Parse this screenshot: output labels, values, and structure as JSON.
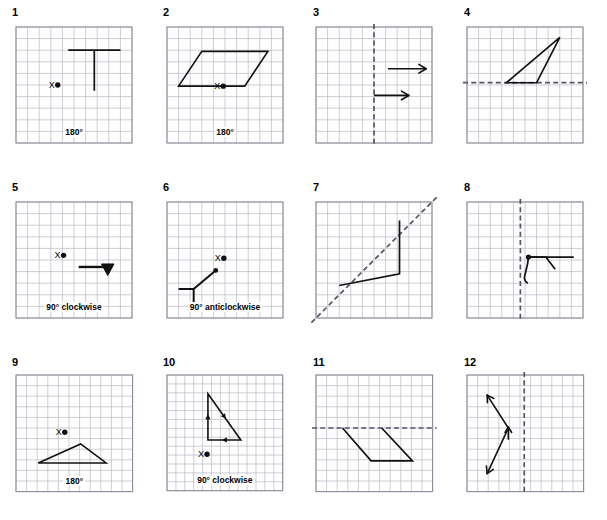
{
  "worksheet": {
    "title": "Transformations worksheet",
    "grid_color": "#b9b9c4",
    "grid_border_color": "#8e8e9c",
    "shape_color": "#111111",
    "mirror_color": "#555566",
    "background": "#ffffff",
    "rows": 3,
    "columns": 4
  },
  "panels": [
    {
      "number": "1",
      "type": "rotation",
      "caption": "180°",
      "center_label": "X",
      "grid": {
        "cols": 10,
        "rows": 10,
        "cell": 11.6
      },
      "shape": {
        "kind": "polyline",
        "points": "4.5,2 9,2 6.75,2 6.75,5.5"
      },
      "center_point": {
        "x": 3.6,
        "y": 5.0
      }
    },
    {
      "number": "2",
      "type": "rotation",
      "caption": "180°",
      "center_label": "X",
      "grid": {
        "cols": 10,
        "rows": 10,
        "cell": 11.6
      },
      "shape": {
        "kind": "polygon",
        "points": "3,2.1 8.7,2.1 6.7,5.1 1,5.1"
      },
      "center_point": {
        "x": 4.85,
        "y": 5.1
      }
    },
    {
      "number": "3",
      "type": "reflection",
      "caption": "",
      "mirror": {
        "orientation": "vertical",
        "at": 5
      },
      "grid": {
        "cols": 10,
        "rows": 10,
        "cell": 11.6
      },
      "arrows": [
        {
          "x1": 6.2,
          "y1": 3.6,
          "x2": 9.5,
          "y2": 3.6
        },
        {
          "x1": 5.0,
          "y1": 5.9,
          "x2": 8.0,
          "y2": 5.9
        }
      ]
    },
    {
      "number": "4",
      "type": "reflection",
      "caption": "",
      "mirror": {
        "orientation": "horizontal",
        "at": 4.8
      },
      "grid": {
        "cols": 10,
        "rows": 10,
        "cell": 11.6
      },
      "shape": {
        "kind": "polygon",
        "points": "3.4,4.8 8.0,0.9 6.0,4.8"
      }
    },
    {
      "number": "5",
      "type": "rotation",
      "caption": "90° clockwise",
      "center_label": "X",
      "grid": {
        "cols": 10,
        "rows": 10,
        "cell": 11.6
      },
      "shape": {
        "kind": "thick-arrow-down",
        "x1": 5.4,
        "x2": 8.1,
        "y": 5.6
      },
      "center_point": {
        "x": 4.1,
        "y": 4.6
      }
    },
    {
      "number": "6",
      "type": "rotation",
      "caption": "90° anticlockwise",
      "center_label": "X",
      "grid": {
        "cols": 10,
        "rows": 10,
        "cell": 11.6
      },
      "shape": {
        "kind": "polyline-dot-end",
        "points": "1.0,7.5 2.3,7.5 2.3,8.8 2.3,7.5 4.2,5.9"
      },
      "center_point": {
        "x": 4.9,
        "y": 4.85
      }
    },
    {
      "number": "7",
      "type": "reflection",
      "caption": "",
      "mirror": {
        "orientation": "diagonal",
        "from": [
          -0.4,
          10.4
        ],
        "to": [
          10.4,
          -0.4
        ]
      },
      "grid": {
        "cols": 10,
        "rows": 10,
        "cell": 11.6
      },
      "shape": {
        "kind": "polyline",
        "points": "2.0,7.2 7.2,6.2 7.2,1.6"
      }
    },
    {
      "number": "8",
      "type": "reflection",
      "caption": "",
      "mirror": {
        "orientation": "vertical",
        "at": 4.6
      },
      "grid": {
        "cols": 10,
        "rows": 10,
        "cell": 11.6
      },
      "shape": {
        "kind": "flag-curve",
        "dot": [
          5.3,
          4.75
        ],
        "horizontal_to": 9.2,
        "vee": "5.3,4.75 6.8,4.75 7.6,5.8",
        "curve": "M 5.3,4.75 C 5.2,6.2 4.6,6.6 5.25,7.0"
      }
    },
    {
      "number": "9",
      "type": "rotation",
      "caption": "180°",
      "center_label": "X",
      "grid": {
        "cols": 11,
        "rows": 11,
        "cell": 10.6
      },
      "shape": {
        "kind": "polygon",
        "points": "2.1,8.3 6.1,6.5 8.5,8.3"
      },
      "center_point": {
        "x": 4.6,
        "y": 5.4
      }
    },
    {
      "number": "10",
      "type": "rotation",
      "caption": "90° clockwise",
      "center_label": "X",
      "grid": {
        "cols": 13,
        "rows": 13,
        "cell": 8.9
      },
      "shape": {
        "kind": "arrow-triangle",
        "points": "4.6,7.3 4.6,2.1 8.3,7.3"
      },
      "center_point": {
        "x": 4.5,
        "y": 8.9
      }
    },
    {
      "number": "11",
      "type": "reflection",
      "caption": "",
      "mirror": {
        "orientation": "horizontal",
        "at": 5.0
      },
      "grid": {
        "cols": 11,
        "rows": 11,
        "cell": 10.6
      },
      "shape": {
        "kind": "polyline",
        "points": "2.5,5.0 5.2,8.1 9.1,8.1 6.2,5.0"
      }
    },
    {
      "number": "12",
      "type": "reflection",
      "caption": "",
      "mirror": {
        "orientation": "vertical",
        "at": 5.4
      },
      "grid": {
        "cols": 11,
        "rows": 11,
        "cell": 10.6
      },
      "shape": {
        "kind": "double-arrow-bent",
        "points": "1.9,1.9 3.9,5.0 1.9,9.3",
        "mid_arrow_at": [
          3.9,
          5.0
        ]
      }
    }
  ]
}
